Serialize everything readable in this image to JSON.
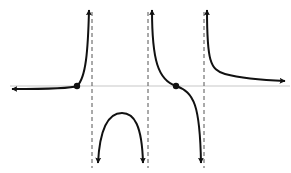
{
  "figure": {
    "colors": {
      "background": "#ffffff",
      "curve": "#111111",
      "axis": "#c8c8c8",
      "asymptote": "#555555",
      "point": "#111111"
    },
    "x_axis": {
      "y": 86,
      "x_start": 10,
      "x_end": 290
    },
    "asymptotes": [
      {
        "x": 92,
        "style": "dashed"
      },
      {
        "x": 148,
        "style": "dashed"
      },
      {
        "x": 204,
        "style": "dashed"
      }
    ],
    "branches": [
      {
        "name": "left-branch",
        "behavior": "approaches 0 from below as x→-∞, crosses axis, →+∞ at first asymptote"
      },
      {
        "name": "middle-lower-branch",
        "behavior": "→-∞ at both asymptotes, local maximum below axis"
      },
      {
        "name": "third-branch",
        "behavior": "+∞ near second asymptote, crosses axis, -∞ at third asymptote"
      },
      {
        "name": "right-branch",
        "behavior": "+∞ near third asymptote, approaches 0 from above as x→+∞"
      }
    ],
    "points": [
      {
        "label": "x-intercept-1",
        "x": 77,
        "y": 86
      },
      {
        "label": "x-intercept-2",
        "x": 176,
        "y": 86
      }
    ]
  }
}
